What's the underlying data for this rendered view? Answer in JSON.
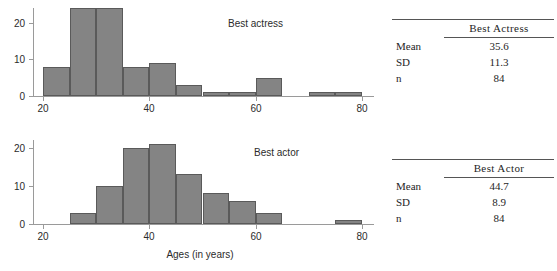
{
  "figure": {
    "x_axis_title": "Ages (in years)"
  },
  "chart_data": [
    {
      "type": "bar",
      "title": "Best actress",
      "xlabel": "Ages (in years)",
      "ylabel": "",
      "xlim": [
        18,
        81
      ],
      "ylim": [
        0,
        24
      ],
      "xticks": [
        20,
        40,
        60,
        80
      ],
      "yticks": [
        0,
        10,
        20
      ],
      "grid": false,
      "bin_width": 5,
      "bin_edges": [
        20,
        25,
        30,
        35,
        40,
        45,
        50,
        55,
        60,
        65,
        70,
        75,
        80
      ],
      "categories": [
        "20-25",
        "25-30",
        "30-35",
        "35-40",
        "40-45",
        "45-50",
        "50-55",
        "55-60",
        "60-65",
        "65-70",
        "70-75",
        "75-80"
      ],
      "values": [
        8,
        24,
        24,
        8,
        9,
        3,
        1,
        1,
        5,
        0,
        1,
        1
      ],
      "legend_position": "inside-right"
    },
    {
      "type": "bar",
      "title": "Best actor",
      "xlabel": "Ages (in years)",
      "ylabel": "",
      "xlim": [
        18,
        81
      ],
      "ylim": [
        0,
        22
      ],
      "xticks": [
        20,
        40,
        60,
        80
      ],
      "yticks": [
        0,
        10,
        20
      ],
      "grid": false,
      "bin_width": 5,
      "bin_edges": [
        20,
        25,
        30,
        35,
        40,
        45,
        50,
        55,
        60,
        65,
        70,
        75,
        80
      ],
      "categories": [
        "20-25",
        "25-30",
        "30-35",
        "35-40",
        "40-45",
        "45-50",
        "50-55",
        "55-60",
        "60-65",
        "65-70",
        "70-75",
        "75-80"
      ],
      "values": [
        0,
        3,
        10,
        20,
        21,
        13,
        8,
        6,
        3,
        0,
        0,
        1
      ],
      "legend_position": "inside-right"
    }
  ],
  "tables": {
    "actress": {
      "header": "Best Actress",
      "rows": [
        {
          "label": "Mean",
          "value": "35.6"
        },
        {
          "label": "SD",
          "value": "11.3"
        },
        {
          "label": "n",
          "value": "84"
        }
      ]
    },
    "actor": {
      "header": "Best Actor",
      "rows": [
        {
          "label": "Mean",
          "value": "44.7"
        },
        {
          "label": "SD",
          "value": "8.9"
        },
        {
          "label": "n",
          "value": "84"
        }
      ]
    }
  }
}
